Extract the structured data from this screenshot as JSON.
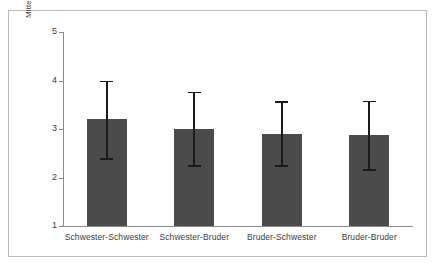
{
  "chart_data": {
    "type": "bar",
    "title": "",
    "xlabel": "",
    "ylabel": "Mittelwert positive Merkmale der Geschwisterbeziehung",
    "ylabel_line1": "Mittelwert positive Merkmale der",
    "ylabel_line2": "Geschwisterbeziehung",
    "categories": [
      "Schwester-Schwester",
      "Schwester-Bruder",
      "Bruder-Schwester",
      "Bruder-Bruder"
    ],
    "values": [
      3.2,
      3.0,
      2.9,
      2.87
    ],
    "error_low": [
      2.4,
      2.25,
      2.25,
      2.17
    ],
    "error_high": [
      4.0,
      3.77,
      3.57,
      3.58
    ],
    "ylim": [
      1,
      5
    ],
    "ytick_labels": [
      "1",
      "2",
      "3",
      "4",
      "5"
    ],
    "ytick_values": [
      1,
      2,
      3,
      4,
      5
    ],
    "grid": false,
    "legend": "none",
    "bar_color": "#4b4b4b",
    "error_color": "#1b1b1b",
    "axis_color": "#8c8c8c",
    "frame_color": "#b9b9b9",
    "background_color": "#ffffff"
  }
}
